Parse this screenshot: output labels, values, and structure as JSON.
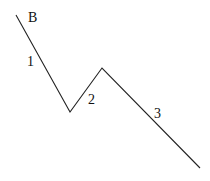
{
  "diagram": {
    "type": "wave-pattern",
    "points": [
      [
        16,
        15
      ],
      [
        70,
        112
      ],
      [
        102,
        68
      ],
      [
        200,
        168
      ]
    ],
    "line_color": "#222222",
    "labels": [
      {
        "id": "start",
        "text": "B",
        "x": 28,
        "y": 22
      },
      {
        "id": "wave1",
        "text": "1",
        "x": 27,
        "y": 66
      },
      {
        "id": "wave2",
        "text": "2",
        "x": 88,
        "y": 104
      },
      {
        "id": "wave3",
        "text": "3",
        "x": 154,
        "y": 118
      }
    ]
  }
}
